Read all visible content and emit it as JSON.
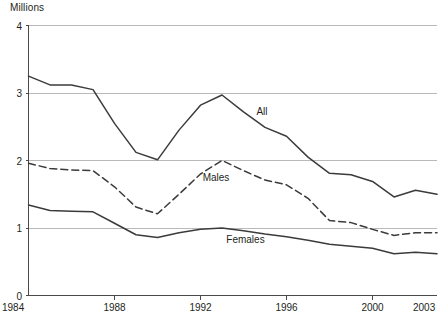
{
  "axis_unit_label": "Millions",
  "labels": {
    "all": "All",
    "males": "Males",
    "females": "Females"
  },
  "colors": {
    "line": "#3b3b3b",
    "grid": "#b9b9b9",
    "axis": "#4a4a4a",
    "text": "#231f20",
    "background": "#ffffff"
  },
  "chart_data": {
    "type": "line",
    "title": "",
    "subtitle": "",
    "xlabel": "",
    "ylabel": "Millions",
    "ylim": [
      0,
      4
    ],
    "xlim": [
      1984,
      2003
    ],
    "yticks": [
      0,
      1,
      2,
      3,
      4
    ],
    "ytick_labels": [
      "0",
      "1",
      "2",
      "3",
      "4"
    ],
    "xticks": [
      1984,
      1988,
      1992,
      1996,
      2000,
      2003
    ],
    "xtick_labels": [
      "1984",
      "1988",
      "1992",
      "1996",
      "2000",
      "2003"
    ],
    "grid": true,
    "grid_axis": "y",
    "legend": "inline-annotations",
    "x": [
      1984,
      1985,
      1986,
      1987,
      1988,
      1989,
      1990,
      1991,
      1992,
      1993,
      1994,
      1995,
      1996,
      1997,
      1998,
      1999,
      2000,
      2001,
      2002,
      2003
    ],
    "series": [
      {
        "name": "All",
        "style": "solid",
        "label_x": 1994.6,
        "label_y": 2.72,
        "values": [
          3.25,
          3.12,
          3.12,
          3.05,
          2.55,
          2.12,
          2.01,
          2.45,
          2.82,
          2.97,
          2.72,
          2.49,
          2.36,
          2.05,
          1.81,
          1.79,
          1.69,
          1.46,
          1.56,
          1.5
        ]
      },
      {
        "name": "Males",
        "style": "dashed",
        "label_x": 1992.1,
        "label_y": 1.74,
        "values": [
          1.96,
          1.88,
          1.86,
          1.85,
          1.61,
          1.31,
          1.21,
          1.5,
          1.8,
          2.0,
          1.85,
          1.71,
          1.64,
          1.44,
          1.11,
          1.08,
          0.98,
          0.89,
          0.93,
          0.93
        ]
      },
      {
        "name": "Females",
        "style": "solid",
        "label_x": 1993.2,
        "label_y": 0.82,
        "values": [
          1.34,
          1.26,
          1.25,
          1.24,
          1.07,
          0.9,
          0.86,
          0.93,
          0.98,
          1.0,
          0.96,
          0.91,
          0.87,
          0.82,
          0.76,
          0.73,
          0.7,
          0.62,
          0.64,
          0.62
        ]
      }
    ]
  }
}
